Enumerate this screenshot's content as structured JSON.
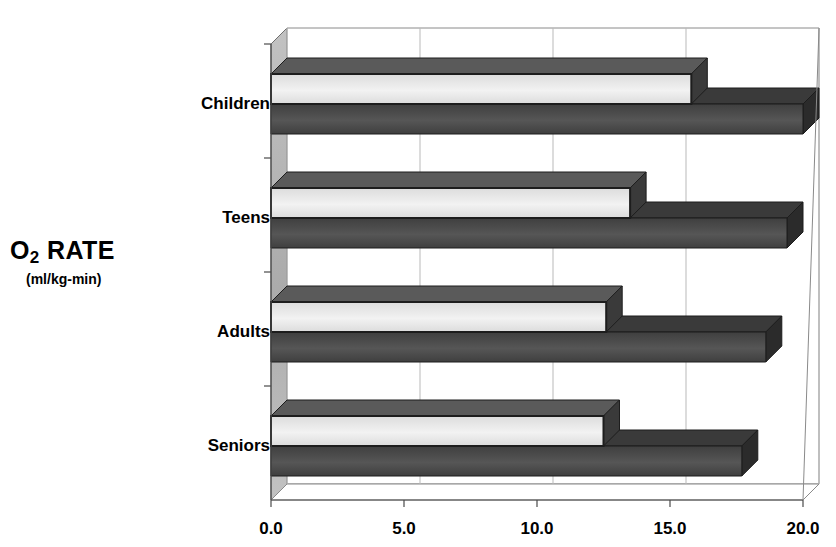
{
  "chart_data": {
    "type": "bar",
    "orientation": "horizontal",
    "style": "3d-grouped-horizontal-bar",
    "title": "",
    "xlabel": "",
    "ylabel": "O2 RATE",
    "ylabel_sub": "(ml/kg-min)",
    "categories": [
      "Children",
      "Teens",
      "Adults",
      "Seniors"
    ],
    "series": [
      {
        "name": "light",
        "values": [
          15.8,
          13.5,
          12.6,
          12.5
        ]
      },
      {
        "name": "dark",
        "values": [
          20.0,
          19.4,
          18.6,
          17.7
        ]
      }
    ],
    "xlim": [
      0.0,
      20.0
    ],
    "xticks": [
      0.0,
      5.0,
      10.0,
      15.0,
      20.0
    ],
    "xtick_labels": [
      "0.0",
      "5.0",
      "10.0",
      "15.0",
      "20.0"
    ],
    "grid": true,
    "legend": "none"
  },
  "axis": {
    "y_title_main": "O",
    "y_title_sub": "2",
    "y_title_rest": " RATE",
    "y_title_units": "(ml/kg-min)"
  },
  "colors": {
    "bar_light_face": "#e9e9e9",
    "bar_light_top": "#5a5a5a",
    "bar_dark_face": "#4a4a4a",
    "bar_dark_top": "#3a3a3a",
    "wall": "#b5b5b5",
    "grid": "#b9b9b9",
    "axis": "#4a4a4a",
    "text": "#000000"
  }
}
